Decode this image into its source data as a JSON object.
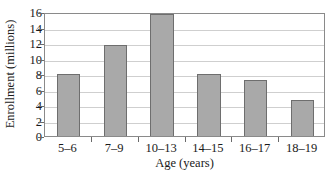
{
  "chart_data": {
    "type": "bar",
    "title": "",
    "xlabel": "Age (years)",
    "ylabel": "Enrollment (millions)",
    "categories": [
      "5–6",
      "7–9",
      "10–13",
      "14–15",
      "16–17",
      "18–19"
    ],
    "values": [
      8.0,
      11.8,
      15.7,
      8.0,
      7.2,
      4.7
    ],
    "ylim": [
      0,
      16
    ],
    "yticks": [
      0,
      2,
      4,
      6,
      8,
      10,
      12,
      14,
      16
    ],
    "ytick_labels": [
      "0",
      "2",
      "4",
      "6",
      "8",
      "10",
      "12",
      "14",
      "16"
    ],
    "grid": true,
    "grid_axis": "y",
    "legend": false,
    "legend_position": "none",
    "bar_color": "#a9a9a9",
    "bar_edge_color": "#6e6e6e",
    "grid_color": "#cfcfcf",
    "frame_color": "#8a8a8a",
    "text_color": "#1a1a1a",
    "bar_width_fraction": 0.5
  }
}
